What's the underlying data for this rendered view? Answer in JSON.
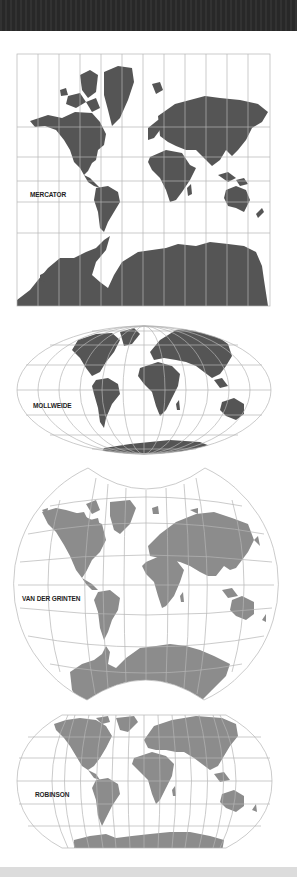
{
  "figure": {
    "colors": {
      "top_band": "#2a2a2a",
      "bottom_band": "#dcdcdc",
      "graticule": "#b5b5b5",
      "land_dark": "#555555",
      "land_light": "#8c8c8c",
      "background": "#ffffff"
    }
  },
  "projections": [
    {
      "id": "mercator",
      "label": "MERCATOR",
      "shape": "rectangle",
      "land_tone": "dark"
    },
    {
      "id": "mollweide",
      "label": "MOLLWEIDE",
      "shape": "ellipse",
      "land_tone": "dark"
    },
    {
      "id": "van-der-grinten",
      "label": "VAN DER GRINTEN",
      "shape": "truncated-circle",
      "land_tone": "light"
    },
    {
      "id": "robinson",
      "label": "ROBINSON",
      "shape": "pseudo-cylindrical",
      "land_tone": "light"
    }
  ]
}
